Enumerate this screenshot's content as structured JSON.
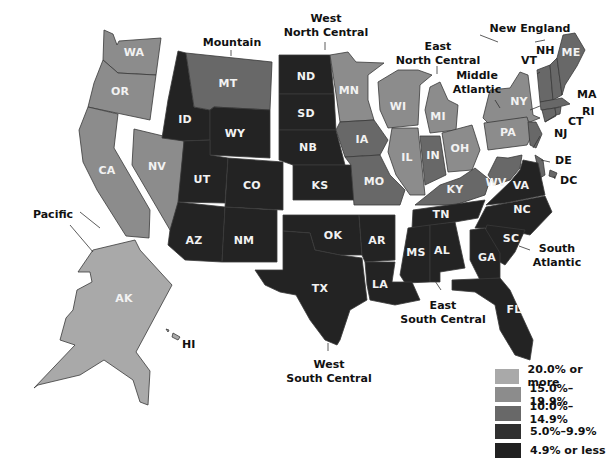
{
  "map": {
    "type": "choropleth",
    "regions": [
      {
        "name": "Pacific",
        "label_lines": [
          "Pacific"
        ]
      },
      {
        "name": "Mountain",
        "label_lines": [
          "Mountain"
        ]
      },
      {
        "name": "West North Central",
        "label_lines": [
          "West",
          "North Central"
        ]
      },
      {
        "name": "East North Central",
        "label_lines": [
          "East",
          "North Central"
        ]
      },
      {
        "name": "Middle Atlantic",
        "label_lines": [
          "Middle",
          "Atlantic"
        ]
      },
      {
        "name": "New England",
        "label_lines": [
          "New England"
        ]
      },
      {
        "name": "South Atlantic",
        "label_lines": [
          "South",
          "Atlantic"
        ]
      },
      {
        "name": "East South Central",
        "label_lines": [
          "East",
          "South Central"
        ]
      },
      {
        "name": "West South Central",
        "label_lines": [
          "West",
          "South Central"
        ]
      }
    ],
    "states": {
      "WA": {
        "label": "WA",
        "region": "Pacific",
        "bin": 2
      },
      "OR": {
        "label": "OR",
        "region": "Pacific",
        "bin": 2
      },
      "CA": {
        "label": "CA",
        "region": "Pacific",
        "bin": 2
      },
      "AK": {
        "label": "AK",
        "region": "Pacific",
        "bin": 1
      },
      "HI": {
        "label": "HI",
        "region": "Pacific",
        "bin": 1
      },
      "MT": {
        "label": "MT",
        "region": "Mountain",
        "bin": 3
      },
      "ID": {
        "label": "ID",
        "region": "Mountain",
        "bin": 5
      },
      "WY": {
        "label": "WY",
        "region": "Mountain",
        "bin": 5
      },
      "NV": {
        "label": "NV",
        "region": "Mountain",
        "bin": 2
      },
      "UT": {
        "label": "UT",
        "region": "Mountain",
        "bin": 5
      },
      "CO": {
        "label": "CO",
        "region": "Mountain",
        "bin": 5
      },
      "AZ": {
        "label": "AZ",
        "region": "Mountain",
        "bin": 5
      },
      "NM": {
        "label": "NM",
        "region": "Mountain",
        "bin": 5
      },
      "ND": {
        "label": "ND",
        "region": "West North Central",
        "bin": 5
      },
      "SD": {
        "label": "SD",
        "region": "West North Central",
        "bin": 5
      },
      "NB": {
        "label": "NB",
        "region": "West North Central",
        "bin": 5
      },
      "KS": {
        "label": "KS",
        "region": "West North Central",
        "bin": 5
      },
      "MN": {
        "label": "MN",
        "region": "West North Central",
        "bin": 2
      },
      "IA": {
        "label": "IA",
        "region": "West North Central",
        "bin": 3
      },
      "MO": {
        "label": "MO",
        "region": "West North Central",
        "bin": 3
      },
      "WI": {
        "label": "WI",
        "region": "East North Central",
        "bin": 2
      },
      "MI": {
        "label": "MI",
        "region": "East North Central",
        "bin": 2
      },
      "IL": {
        "label": "IL",
        "region": "East North Central",
        "bin": 2
      },
      "IN": {
        "label": "IN",
        "region": "East North Central",
        "bin": 3
      },
      "OH": {
        "label": "OH",
        "region": "East North Central",
        "bin": 2
      },
      "NY": {
        "label": "NY",
        "region": "Middle Atlantic",
        "bin": 2
      },
      "PA": {
        "label": "PA",
        "region": "Middle Atlantic",
        "bin": 2
      },
      "NJ": {
        "label": "NJ",
        "region": "Middle Atlantic",
        "bin": 3
      },
      "ME": {
        "label": "ME",
        "region": "New England",
        "bin": 3
      },
      "VT": {
        "label": "VT",
        "region": "New England",
        "bin": 3
      },
      "NH": {
        "label": "NH",
        "region": "New England",
        "bin": 3
      },
      "MA": {
        "label": "MA",
        "region": "New England",
        "bin": 3
      },
      "RI": {
        "label": "RI",
        "region": "New England",
        "bin": 3
      },
      "CT": {
        "label": "CT",
        "region": "New England",
        "bin": 3
      },
      "DE": {
        "label": "DE",
        "region": "South Atlantic",
        "bin": 3
      },
      "DC": {
        "label": "DC",
        "region": "South Atlantic",
        "bin": 3
      },
      "WV": {
        "label": "WV",
        "region": "South Atlantic",
        "bin": 3
      },
      "VA": {
        "label": "VA",
        "region": "South Atlantic",
        "bin": 5
      },
      "NC": {
        "label": "NC",
        "region": "South Atlantic",
        "bin": 5
      },
      "SC": {
        "label": "SC",
        "region": "South Atlantic",
        "bin": 5
      },
      "GA": {
        "label": "GA",
        "region": "South Atlantic",
        "bin": 5
      },
      "FL": {
        "label": "FL",
        "region": "South Atlantic",
        "bin": 5
      },
      "KY": {
        "label": "KY",
        "region": "East South Central",
        "bin": 3
      },
      "TN": {
        "label": "TN",
        "region": "East South Central",
        "bin": 5
      },
      "MS": {
        "label": "MS",
        "region": "East South Central",
        "bin": 5
      },
      "AL": {
        "label": "AL",
        "region": "East South Central",
        "bin": 5
      },
      "OK": {
        "label": "OK",
        "region": "West South Central",
        "bin": 5
      },
      "TX": {
        "label": "TX",
        "region": "West South Central",
        "bin": 5
      },
      "AR": {
        "label": "AR",
        "region": "West South Central",
        "bin": 5
      },
      "LA": {
        "label": "LA",
        "region": "West South Central",
        "bin": 5
      }
    }
  },
  "legend": {
    "items": [
      {
        "bin": 1,
        "label": "20.0% or more",
        "color": "#a9a9a9"
      },
      {
        "bin": 2,
        "label": "15.0%–19.9%",
        "color": "#8c8c8c"
      },
      {
        "bin": 3,
        "label": "10.0%–14.9%",
        "color": "#686868"
      },
      {
        "bin": 4,
        "label": "5.0%–9.9%",
        "color": "#303030"
      },
      {
        "bin": 5,
        "label": "4.9% or less",
        "color": "#212121"
      }
    ]
  },
  "colors": {
    "bin1": "#a9a9a9",
    "bin2": "#8c8c8c",
    "bin3": "#686868",
    "bin4": "#303030",
    "bin5": "#232323",
    "background": "#ffffff"
  }
}
